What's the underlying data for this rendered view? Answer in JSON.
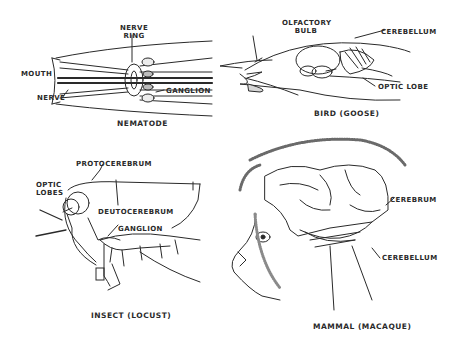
{
  "panels": {
    "nematode": {
      "caption": "NEMATODE",
      "labels": {
        "nerve_ring_1": "NERVE",
        "nerve_ring_2": "RING",
        "mouth": "MOUTH",
        "nerve": "NERVE",
        "ganglion": "GANGLION"
      }
    },
    "bird": {
      "caption": "BIRD (GOOSE)",
      "labels": {
        "olfactory_1": "OLFACTORY",
        "olfactory_2": "BULB",
        "cerebellum": "CEREBELLUM",
        "optic_lobe": "OPTIC LOBE"
      }
    },
    "insect": {
      "caption": "INSECT (LOCUST)",
      "labels": {
        "protocerebrum": "PROTOCEREBRUM",
        "optic_1": "OPTIC",
        "optic_2": "LOBES",
        "deutocerebrum": "DEUTOCEREBRUM",
        "ganglion": "GANGLION"
      }
    },
    "mammal": {
      "caption": "MAMMAL (MACAQUE)",
      "labels": {
        "cerebrum": "CEREBRUM",
        "cerebellum": "CEREBELLUM"
      }
    }
  },
  "colors": {
    "ink": "#2a2a2a",
    "shade": "#9a9a9a",
    "paper": "#ffffff"
  }
}
